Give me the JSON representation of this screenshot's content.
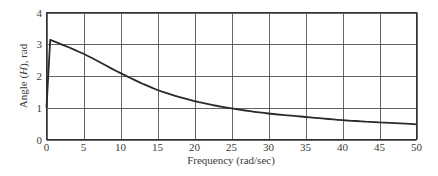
{
  "chart_data": {
    "type": "line",
    "title": "",
    "xlabel": "Frequency (rad/sec)",
    "ylabel": "Angle (H), rad",
    "ylabel_parts": {
      "pre": "Angle (",
      "italic": "H",
      "post": "), rad"
    },
    "xlim": [
      0,
      50
    ],
    "ylim": [
      0,
      4
    ],
    "grid": true,
    "legend": null,
    "x_ticks": [
      0,
      5,
      10,
      15,
      20,
      25,
      30,
      35,
      40,
      45,
      50
    ],
    "y_ticks": [
      0,
      1,
      2,
      3,
      4
    ],
    "series": [
      {
        "name": "Angle(H)",
        "color": "#2a2a2a",
        "x": [
          0,
          0.5,
          5,
          10,
          15,
          20,
          25,
          30,
          35,
          40,
          45,
          50
        ],
        "y": [
          1.0,
          3.14,
          2.7,
          2.09,
          1.56,
          1.21,
          0.98,
          0.82,
          0.71,
          0.61,
          0.54,
          0.48
        ]
      }
    ]
  },
  "style": {
    "grid_color": "#555555",
    "axis_color": "#333333",
    "line_color": "#2a2a2a"
  }
}
